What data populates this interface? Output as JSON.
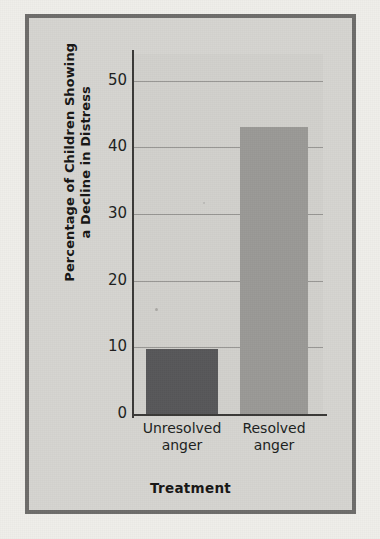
{
  "figure": {
    "frame_color": "#6e6d6b",
    "page_background": "#efeeea",
    "panel_background": "#d2d1cd"
  },
  "chart_data": {
    "type": "bar",
    "title": "",
    "subtitle": "",
    "xlabel": "Treatment",
    "ylabel": "Percentage of Children Showing a Decline in Distress",
    "ylabel_line1": "Percentage of Children Showing",
    "ylabel_line2": "a Decline in Distress",
    "categories": [
      "Unresolved anger",
      "Resolved anger"
    ],
    "category_lines": [
      [
        "Unresolved",
        "anger"
      ],
      [
        "Resolved",
        "anger"
      ]
    ],
    "values": [
      9.7,
      43.1
    ],
    "ylim": [
      0,
      54
    ],
    "yticks": [
      0,
      10,
      20,
      30,
      40,
      50
    ],
    "ytick_labels": [
      "0",
      "10",
      "20",
      "30",
      "40",
      "50"
    ],
    "grid": true,
    "grid_axis": "y",
    "legend": "none",
    "bar_colors": [
      "#58585a",
      "#9b9a97"
    ]
  }
}
